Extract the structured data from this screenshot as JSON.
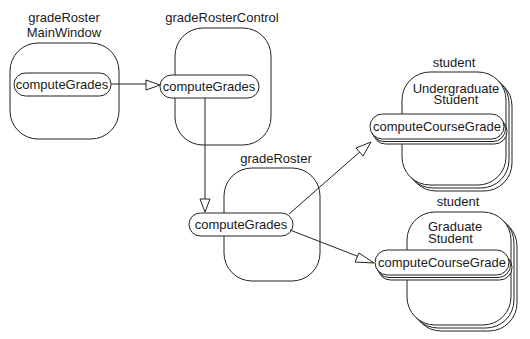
{
  "diagram": {
    "type": "collaboration",
    "objects": [
      {
        "id": "main_window",
        "label_line1": "gradeRoster",
        "label_line2": "MainWindow",
        "operation": "computeGrades"
      },
      {
        "id": "control",
        "label": "gradeRosterControl",
        "operation": "computeGrades"
      },
      {
        "id": "roster",
        "label": "gradeRoster",
        "operation": "computeGrades"
      },
      {
        "id": "undergrad",
        "label": "student",
        "inner_line1": "Undergraduate",
        "inner_line2": "Student",
        "operation": "computeCourseGrade",
        "multi": true
      },
      {
        "id": "grad",
        "label": "student",
        "inner_line1": "Graduate",
        "inner_line2": "Student",
        "operation": "computeCourseGrade",
        "multi": true
      }
    ],
    "messages": [
      {
        "from": "main_window",
        "to": "control"
      },
      {
        "from": "control",
        "to": "roster"
      },
      {
        "from": "roster",
        "to": "undergrad"
      },
      {
        "from": "roster",
        "to": "grad"
      }
    ],
    "colors": {
      "stroke": "#222222",
      "background": "#ffffff"
    }
  }
}
